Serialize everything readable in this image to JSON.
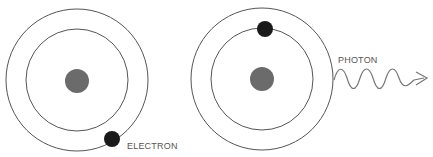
{
  "diagram": {
    "colors": {
      "background": "#ffffff",
      "orbit": "#555555",
      "nucleus": "#6b6b6b",
      "electron": "#1a1a1a",
      "photon": "#777777",
      "label": "#555555"
    },
    "atoms": [
      {
        "name": "ground-state-atom",
        "electron_orbit": "outer",
        "label": "ELECTRON"
      },
      {
        "name": "excited-state-atom",
        "electron_orbit": "inner",
        "emission_label": "PHOTON"
      }
    ]
  }
}
